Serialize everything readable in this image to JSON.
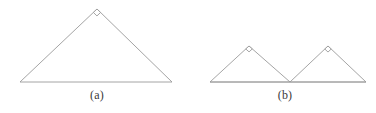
{
  "figure": {
    "background_color": "#ffffff",
    "stroke_color": "#9a9a9a",
    "stroke_width": 0.9,
    "caption_color": "#3a3a3a",
    "width": 376,
    "height": 113,
    "subfigures": [
      {
        "id": "a",
        "caption": "(a)",
        "description": "single triangle with right angle at apex",
        "shapes": [
          {
            "name": "triangle-a",
            "type": "polygon",
            "points": "20,82 97,9 172,82",
            "closed": true
          }
        ],
        "right_angle_markers": [
          {
            "name": "right-angle-marker-a-apex",
            "vertex": [
              97,
              9
            ],
            "size": 5.0,
            "toward": [
              [
                20,
                82
              ],
              [
                172,
                82
              ]
            ]
          }
        ]
      },
      {
        "id": "b",
        "caption": "(b)",
        "description": "two triangles sharing a common baseline, each with right angle at apex",
        "shapes": [
          {
            "name": "triangle-b-left",
            "type": "polygon",
            "points": "210,82 249,46 290,82",
            "closed": true
          },
          {
            "name": "triangle-b-right",
            "type": "polygon",
            "points": "290,82 328,46 366,82",
            "closed": true
          },
          {
            "name": "baseline-b",
            "type": "line",
            "points": "210,82 366,82",
            "closed": false
          }
        ],
        "right_angle_markers": [
          {
            "name": "right-angle-marker-b-left-apex",
            "vertex": [
              249,
              46
            ],
            "size": 4.4,
            "toward": [
              [
                210,
                82
              ],
              [
                290,
                82
              ]
            ]
          },
          {
            "name": "right-angle-marker-b-right-apex",
            "vertex": [
              328,
              46
            ],
            "size": 4.4,
            "toward": [
              [
                290,
                82
              ],
              [
                366,
                82
              ]
            ]
          }
        ]
      }
    ]
  }
}
